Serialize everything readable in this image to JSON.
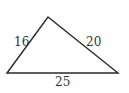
{
  "diagram": {
    "type": "triangle",
    "stroke_color": "#2a2a2a",
    "label_color": "#333333",
    "vertices": {
      "left": [
        7,
        73
      ],
      "top": [
        48,
        17
      ],
      "right": [
        118,
        73
      ]
    },
    "sides": [
      {
        "name": "left",
        "label": "16"
      },
      {
        "name": "right",
        "label": "20"
      },
      {
        "name": "bottom",
        "label": "25"
      }
    ]
  }
}
